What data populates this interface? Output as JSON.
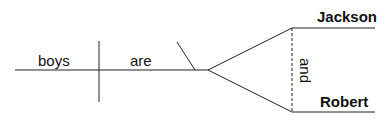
{
  "diagram": {
    "type": "sentence-diagram",
    "subject": "boys",
    "verb": "are",
    "predicate_nominatives": {
      "items": [
        "Jackson",
        "Robert"
      ],
      "conjunction": "and"
    },
    "colors": {
      "line": "#222222",
      "text": "#111111",
      "background": "#ffffff"
    }
  }
}
